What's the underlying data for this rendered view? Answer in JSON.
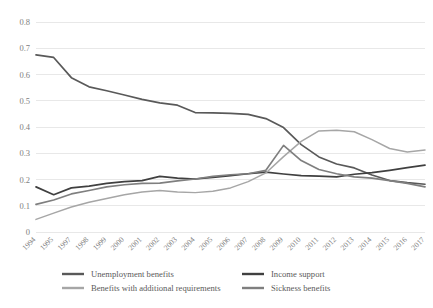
{
  "chart_data": {
    "type": "line",
    "title": "",
    "subtitle": "",
    "xlabel": "",
    "ylabel": "",
    "grid": true,
    "legend_position": "bottom",
    "ylim": [
      0,
      0.8
    ],
    "yticks": [
      "0",
      "0.1",
      "0.2",
      "0.3",
      "0.4",
      "0.5",
      "0.6",
      "0.7",
      "0.8"
    ],
    "ytick_values": [
      0,
      0.1,
      0.2,
      0.3,
      0.4,
      0.5,
      0.6,
      0.7,
      0.8
    ],
    "categories": [
      "1994",
      "1995",
      "1997",
      "1998",
      "1999",
      "2000",
      "2001",
      "2002",
      "2003",
      "2004",
      "2005",
      "2006",
      "2007",
      "2008",
      "2009",
      "2010",
      "2011",
      "2012",
      "2013",
      "2014",
      "2015",
      "2016",
      "2017"
    ],
    "series": [
      {
        "name": "Unemployment benefits",
        "color": "#595959",
        "values": [
          0.675,
          0.665,
          0.588,
          0.553,
          0.538,
          0.522,
          0.505,
          0.492,
          0.483,
          0.455,
          0.454,
          0.452,
          0.448,
          0.432,
          0.398,
          0.333,
          0.286,
          0.259,
          0.244,
          0.217,
          0.196,
          0.188,
          0.182
        ]
      },
      {
        "name": "Income support",
        "color": "#404040",
        "values": [
          0.172,
          0.142,
          0.168,
          0.175,
          0.185,
          0.192,
          0.196,
          0.212,
          0.205,
          0.202,
          0.208,
          0.215,
          0.222,
          0.228,
          0.221,
          0.215,
          0.213,
          0.21,
          0.22,
          0.226,
          0.235,
          0.245,
          0.255
        ]
      },
      {
        "name": "Benefits with additional requirements",
        "color": "#a6a6a6",
        "values": [
          0.048,
          0.072,
          0.095,
          0.113,
          0.128,
          0.142,
          0.152,
          0.158,
          0.152,
          0.15,
          0.155,
          0.168,
          0.192,
          0.225,
          0.287,
          0.345,
          0.385,
          0.388,
          0.382,
          0.352,
          0.318,
          0.305,
          0.312
        ]
      },
      {
        "name": "Sickness benefits",
        "color": "#7f7f7f",
        "values": [
          0.105,
          0.122,
          0.145,
          0.158,
          0.172,
          0.18,
          0.185,
          0.186,
          0.195,
          0.202,
          0.212,
          0.218,
          0.222,
          0.235,
          0.33,
          0.272,
          0.238,
          0.222,
          0.21,
          0.205,
          0.196,
          0.185,
          0.172
        ]
      }
    ]
  },
  "legend": {
    "items": [
      {
        "label": "Unemployment benefits",
        "color": "#595959"
      },
      {
        "label": "Income support",
        "color": "#404040"
      },
      {
        "label": "Benefits with additional requirements",
        "color": "#a6a6a6"
      },
      {
        "label": "Sickness benefits",
        "color": "#7f7f7f"
      }
    ]
  }
}
